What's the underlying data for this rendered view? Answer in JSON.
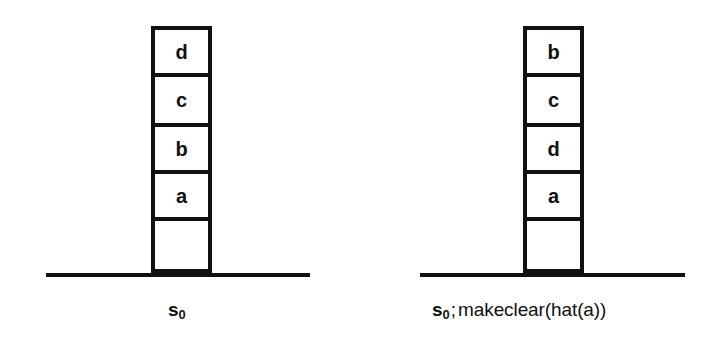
{
  "figure": {
    "background_color": "#ffffff",
    "ink_color": "#111111",
    "width": 721,
    "height": 343
  },
  "panels": [
    {
      "id": "left",
      "name": "initial-state-panel",
      "stack": {
        "name": "block-stack-left",
        "left": 151,
        "top": 26,
        "blocks": [
          {
            "label": "d",
            "height": 47,
            "empty": false
          },
          {
            "label": "c",
            "height": 50,
            "empty": false
          },
          {
            "label": "b",
            "height": 47,
            "empty": false
          },
          {
            "label": "a",
            "height": 47,
            "empty": false
          },
          {
            "label": "",
            "height": 56,
            "empty": true
          }
        ]
      },
      "ground": {
        "left": 46,
        "top": 273,
        "width": 264
      },
      "caption": {
        "left": 168,
        "top": 300,
        "symbol": "s",
        "subscript": "0",
        "separator": "",
        "operation": "",
        "full_text": "s0"
      }
    },
    {
      "id": "right",
      "name": "result-state-panel",
      "stack": {
        "name": "block-stack-right",
        "left": 523,
        "top": 26,
        "blocks": [
          {
            "label": "b",
            "height": 47,
            "empty": false
          },
          {
            "label": "c",
            "height": 50,
            "empty": false
          },
          {
            "label": "d",
            "height": 47,
            "empty": false
          },
          {
            "label": "a",
            "height": 47,
            "empty": false
          },
          {
            "label": "",
            "height": 56,
            "empty": true
          }
        ]
      },
      "ground": {
        "left": 420,
        "top": 273,
        "width": 265
      },
      "caption": {
        "left": 432,
        "top": 300,
        "symbol": "s",
        "subscript": "0",
        "separator": ";",
        "operation": "makeclear(hat(a))",
        "full_text": "s0 ; makeclear(hat(a))"
      }
    }
  ]
}
